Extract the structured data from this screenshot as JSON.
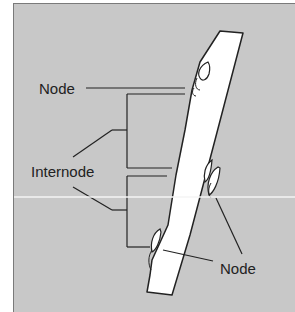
{
  "diagram": {
    "labels": {
      "node_top": "Node",
      "internode": "Internode",
      "node_bottom": "Node"
    },
    "colors": {
      "background": "#c8c8c8",
      "stem": "#ffffff",
      "ink": "#222222"
    }
  }
}
